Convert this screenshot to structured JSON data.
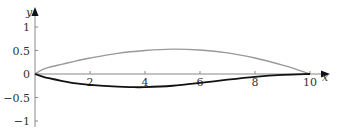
{
  "chart_data": {
    "type": "line",
    "title": "",
    "xlabel": "x",
    "ylabel": "y",
    "xlim": [
      0,
      10.5
    ],
    "ylim": [
      -1.1,
      1.3
    ],
    "grid": false,
    "legend": null,
    "x_ticks": [
      2,
      4,
      6,
      8,
      10
    ],
    "x_tick_labels": [
      "2",
      "4",
      "6",
      "8",
      "10"
    ],
    "y_ticks": [
      1,
      0.5,
      0,
      -0.5,
      -1
    ],
    "y_tick_labels": [
      "1",
      "0.5",
      "0",
      "−0.5",
      "−1"
    ],
    "series": [
      {
        "name": "upper curve",
        "color": "#999999",
        "x": [
          0,
          0.25,
          0.5,
          1,
          1.5,
          2,
          3,
          4,
          5,
          6,
          7,
          8,
          9,
          9.5,
          10
        ],
        "y": [
          0,
          0.09,
          0.14,
          0.21,
          0.28,
          0.34,
          0.44,
          0.5,
          0.53,
          0.51,
          0.45,
          0.34,
          0.19,
          0.1,
          0
        ]
      },
      {
        "name": "lower curve",
        "color": "#111111",
        "x": [
          0,
          0.25,
          0.5,
          1,
          1.5,
          2,
          3,
          3.5,
          4,
          5,
          6,
          7,
          8,
          9,
          10
        ],
        "y": [
          0,
          -0.05,
          -0.09,
          -0.15,
          -0.2,
          -0.23,
          -0.27,
          -0.28,
          -0.28,
          -0.25,
          -0.19,
          -0.12,
          -0.06,
          -0.02,
          0
        ]
      }
    ]
  },
  "axes": {
    "x_label": "x",
    "y_label": "y",
    "origin_label": "0"
  }
}
